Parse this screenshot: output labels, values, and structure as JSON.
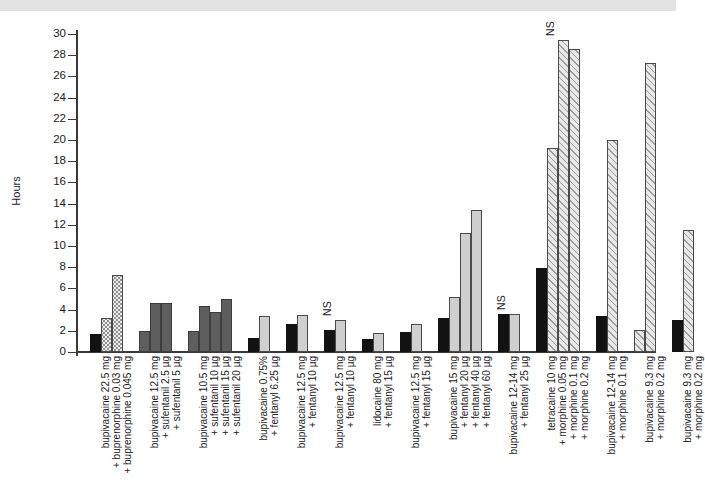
{
  "chart_data": {
    "type": "bar",
    "title": "",
    "xlabel": "",
    "ylabel": "Hours",
    "ylim": [
      0,
      30
    ],
    "yticks": [
      0,
      2,
      4,
      6,
      8,
      10,
      12,
      14,
      16,
      18,
      20,
      22,
      24,
      26,
      28,
      30
    ],
    "grid": false,
    "legend": "none",
    "annotations": [
      "NS"
    ],
    "groups": [
      {
        "label_lines": [
          "bupivacaine 22.5 mg",
          "+ buprenorphine  0.03 mg",
          "+ buprenorphine  0.045 mg"
        ],
        "bars": [
          {
            "label": "bupivacaine 22.5 mg",
            "value": 1.7,
            "fill": "black"
          },
          {
            "label": "+ buprenorphine 0.03 mg",
            "value": 3.2,
            "fill": "dot"
          },
          {
            "label": "+ buprenorphine 0.045 mg",
            "value": 7.3,
            "fill": "dot"
          }
        ]
      },
      {
        "label_lines": [
          "bupivacaine 12.5 mg",
          "+ sufentanil 2.5 µg",
          "+ sufentanil 5 µg"
        ],
        "bars": [
          {
            "label": "bupivacaine 12.5 mg",
            "value": 2.0,
            "fill": "dark"
          },
          {
            "label": "+ sufentanil 2.5 µg",
            "value": 4.6,
            "fill": "dark"
          },
          {
            "label": "+ sufentanil 5 µg",
            "value": 4.6,
            "fill": "dark"
          }
        ]
      },
      {
        "label_lines": [
          "bupivacaine 10.5 mg",
          "+ sufentanil 10 µg",
          "+ sufentanil 15 µg",
          "+ sufentanil 20 µg"
        ],
        "bars": [
          {
            "label": "bupivacaine 10.5 mg",
            "value": 2.0,
            "fill": "dark"
          },
          {
            "label": "+ sufentanil 10 µg",
            "value": 4.3,
            "fill": "dark"
          },
          {
            "label": "+ sufentanil 15 µg",
            "value": 3.8,
            "fill": "dark"
          },
          {
            "label": "+ sufentanil 20 µg",
            "value": 5.0,
            "fill": "dark"
          }
        ]
      },
      {
        "label_lines": [
          "bupivacaine 0.75%",
          "+ fentanyl 6.25 µg"
        ],
        "bars": [
          {
            "label": "bupivacaine 0.75%",
            "value": 1.3,
            "fill": "black"
          },
          {
            "label": "+ fentanyl 6.25 µg",
            "value": 3.4,
            "fill": "light"
          }
        ]
      },
      {
        "label_lines": [
          "bupivacaine 12.5 mg",
          "+ fentanyl 10 µg"
        ],
        "bars": [
          {
            "label": "bupivacaine 12.5 mg",
            "value": 2.6,
            "fill": "black"
          },
          {
            "label": "+ fentanyl 10 µg",
            "value": 3.5,
            "fill": "light"
          }
        ]
      },
      {
        "label_lines": [
          "bupivacaine 12.5 mg",
          "+ fentanyl 10 µg"
        ],
        "annotation": "NS",
        "bars": [
          {
            "label": "bupivacaine 12.5 mg",
            "value": 2.1,
            "fill": "black"
          },
          {
            "label": "+ fentanyl 10 µg",
            "value": 3.0,
            "fill": "light"
          }
        ]
      },
      {
        "label_lines": [
          "lidocaine 80 mg",
          "+ fentanyl 15 µg"
        ],
        "bars": [
          {
            "label": "lidocaine 80 mg",
            "value": 1.2,
            "fill": "black"
          },
          {
            "label": "+ fentanyl 15 µg",
            "value": 1.8,
            "fill": "light"
          }
        ]
      },
      {
        "label_lines": [
          "bupivacaine 12.5 mg",
          "+ fentanyl 15 µg"
        ],
        "bars": [
          {
            "label": "bupivacaine 12.5 mg",
            "value": 1.9,
            "fill": "black"
          },
          {
            "label": "+ fentanyl 15 µg",
            "value": 2.6,
            "fill": "light"
          }
        ]
      },
      {
        "label_lines": [
          "bupivacaine 15 mg",
          "+ fentanyl 20 µg",
          "+ fentanyl 40 µg",
          "+ fentanyl 60 µg"
        ],
        "bars": [
          {
            "label": "bupivacaine 15 mg",
            "value": 3.2,
            "fill": "black"
          },
          {
            "label": "+ fentanyl 20 µg",
            "value": 5.2,
            "fill": "light"
          },
          {
            "label": "+ fentanyl 40 µg",
            "value": 11.2,
            "fill": "light"
          },
          {
            "label": "+ fentanyl 60 µg",
            "value": 13.4,
            "fill": "light"
          }
        ]
      },
      {
        "label_lines": [
          "bupivacaine 12-14 mg",
          "+ fentanyl 25 µg"
        ],
        "annotation": "NS",
        "bars": [
          {
            "label": "bupivacaine 12-14 mg",
            "value": 3.6,
            "fill": "black"
          },
          {
            "label": "+ fentanyl 25 µg",
            "value": 3.6,
            "fill": "light"
          }
        ]
      },
      {
        "label_lines": [
          "tetracaine 10 mg",
          "+ morphine 0.05 mg",
          "+ morphine 0.1 mg",
          "+ morphine 0.2 mg"
        ],
        "annotation": "NS",
        "bars": [
          {
            "label": "tetracaine 10 mg",
            "value": 7.9,
            "fill": "black"
          },
          {
            "label": "+ morphine 0.05 mg",
            "value": 19.2,
            "fill": "hatch"
          },
          {
            "label": "+ morphine 0.1 mg",
            "value": 29.4,
            "fill": "hatch"
          },
          {
            "label": "+ morphine 0.2 mg",
            "value": 28.6,
            "fill": "hatch"
          }
        ]
      },
      {
        "label_lines": [
          "bupivacaine 12-14 mg",
          "+ morphine 0.1 mg"
        ],
        "bars": [
          {
            "label": "bupivacaine 12-14 mg",
            "value": 3.4,
            "fill": "black"
          },
          {
            "label": "+ morphine 0.1 mg",
            "value": 20.0,
            "fill": "hatch"
          }
        ]
      },
      {
        "label_lines": [
          "bupivacaine 9.3 mg",
          "+ morphine 0.2 mg"
        ],
        "bars": [
          {
            "label": "bupivacaine 9.3 mg",
            "value": 2.1,
            "fill": "hatch"
          },
          {
            "label": "+ morphine 0.2 mg",
            "value": 27.3,
            "fill": "hatch"
          }
        ]
      },
      {
        "label_lines": [
          "bupivacaine 9.3 mg",
          "+ morphine 0.2 mg"
        ],
        "bars": [
          {
            "label": "bupivacaine 9.3 mg",
            "value": 3.0,
            "fill": "black"
          },
          {
            "label": "+ morphine 0.2 mg",
            "value": 11.5,
            "fill": "hatch"
          }
        ]
      }
    ]
  }
}
